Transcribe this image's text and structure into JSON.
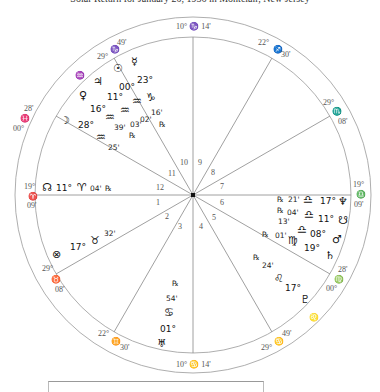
{
  "title": "Solar Return for January 20, 1956 in Montclair, New Jersey",
  "chart": {
    "center": [
      193,
      195
    ],
    "outer_radius": 178,
    "inner_radius": 158,
    "line_color": "#888888"
  },
  "cusps": [
    {
      "house": 10,
      "deg": "10°",
      "sign": "♑",
      "min": "14'",
      "label": "10° ♑ 14'"
    },
    {
      "house": 11,
      "deg": "29°",
      "sign": "♑",
      "min": "49'"
    },
    {
      "house": 12,
      "deg": "00°",
      "sign": "♓",
      "min": "28'"
    },
    {
      "house": 1,
      "deg": "19°",
      "sign": "♈",
      "min": "09'"
    },
    {
      "house": 2,
      "deg": "29°",
      "sign": "♉",
      "min": "08'"
    },
    {
      "house": 3,
      "deg": "22°",
      "sign": "♊",
      "min": "30'"
    },
    {
      "house": 4,
      "deg": "10°",
      "sign": "♋",
      "min": "14'",
      "label": "10° ♋ 14'"
    },
    {
      "house": 5,
      "deg": "29°",
      "sign": "♋",
      "min": "49'"
    },
    {
      "house": 6,
      "deg": "00°",
      "sign": "♍",
      "min": "28'"
    },
    {
      "house": 7,
      "deg": "19°",
      "sign": "♎",
      "min": "09'"
    },
    {
      "house": 8,
      "deg": "29°",
      "sign": "♏",
      "min": "08'"
    },
    {
      "house": 9,
      "deg": "22°",
      "sign": "♐",
      "min": "30'"
    }
  ],
  "intercepted_signs": {
    "house11": "♒",
    "house5": "♌"
  },
  "house_numbers": [
    "1",
    "2",
    "3",
    "4",
    "5",
    "6",
    "7",
    "8",
    "9",
    "10",
    "11",
    "12"
  ],
  "planets": [
    {
      "name": "Mercury",
      "glyph": "☿",
      "deg": "23°",
      "sign": "♑",
      "min": "16'",
      "retro": "℞"
    },
    {
      "name": "Sun",
      "glyph": "☉",
      "deg": "00°",
      "sign": "♒",
      "min": "02'",
      "retro": ""
    },
    {
      "name": "Jupiter",
      "glyph": "♃",
      "deg": "11°",
      "sign": "♒",
      "min": "03'",
      "retro": "℞"
    },
    {
      "name": "Venus",
      "glyph": "♀",
      "deg": "16°",
      "sign": "♒",
      "min": "39'",
      "retro": ""
    },
    {
      "name": "Moon",
      "glyph": "☽",
      "deg": "28°",
      "sign": "♒",
      "min": "25'",
      "retro": ""
    },
    {
      "name": "North Node",
      "glyph": "☊",
      "deg": "11°",
      "sign": "♈",
      "min": "04'",
      "retro": "℞"
    },
    {
      "name": "Part of Fortune",
      "glyph": "⊗",
      "deg": "17°",
      "sign": "♉",
      "min": "32'",
      "retro": ""
    },
    {
      "name": "Uranus",
      "glyph": "♅",
      "deg": "01°",
      "sign": "♋",
      "min": "54'",
      "retro": "℞"
    },
    {
      "name": "Pluto",
      "glyph": "♇",
      "deg": "17°",
      "sign": "♌",
      "min": "24'",
      "retro": "℞"
    },
    {
      "name": "Saturn",
      "glyph": "♄",
      "deg": "19°",
      "sign": "♍",
      "min": "01'",
      "retro": "℞"
    },
    {
      "name": "Mars",
      "glyph": "♂",
      "deg": "08°",
      "sign": "♎",
      "min": "13'",
      "retro": ""
    },
    {
      "name": "South Node",
      "glyph": "☋",
      "deg": "11°",
      "sign": "♎",
      "min": "04'",
      "retro": "℞"
    },
    {
      "name": "Neptune",
      "glyph": "♆",
      "deg": "17°",
      "sign": "♎",
      "min": "21'",
      "retro": "℞"
    }
  ]
}
